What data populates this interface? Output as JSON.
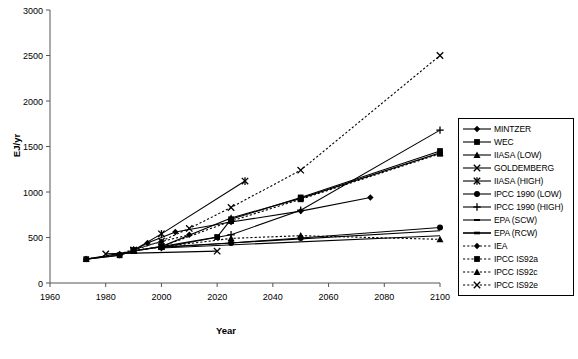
{
  "chart_data": {
    "type": "line",
    "title": "",
    "xlabel": "Year",
    "ylabel": "EJ/yr",
    "xlim": [
      1960,
      2100
    ],
    "ylim": [
      0,
      3000
    ],
    "xticks": [
      1960,
      1980,
      2000,
      2020,
      2040,
      2060,
      2080,
      2100
    ],
    "yticks": [
      0,
      500,
      1000,
      1500,
      2000,
      2500,
      3000
    ],
    "grid": false,
    "legend_position": "right",
    "series": [
      {
        "name": "MINTZER",
        "marker": "diamond",
        "linestyle": "solid",
        "color": "#000000",
        "x": [
          1973,
          1985,
          1990,
          1995,
          2005,
          2025,
          2050,
          2075
        ],
        "y": [
          262,
          305,
          360,
          440,
          560,
          670,
          790,
          940
        ]
      },
      {
        "name": "WEC",
        "marker": "square",
        "linestyle": "solid",
        "color": "#000000",
        "x": [
          1973,
          1985,
          1990,
          2000,
          2020,
          2025,
          2050,
          2100
        ],
        "y": [
          262,
          305,
          355,
          400,
          505,
          700,
          940,
          1450
        ]
      },
      {
        "name": "IIASA (LOW)",
        "marker": "triangle",
        "linestyle": "solid",
        "color": "#000000",
        "x": [
          1973,
          1990,
          2000,
          2025,
          2050,
          2100
        ],
        "y": [
          262,
          350,
          400,
          715,
          930,
          1430
        ]
      },
      {
        "name": "GOLDEMBERG",
        "marker": "x",
        "linestyle": "solid",
        "color": "#000000",
        "x": [
          1980,
          2020
        ],
        "y": [
          320,
          350
        ]
      },
      {
        "name": "IIASA (HIGH)",
        "marker": "star",
        "linestyle": "solid",
        "color": "#000000",
        "x": [
          1990,
          2000,
          2030
        ],
        "y": [
          360,
          540,
          1120
        ]
      },
      {
        "name": "IPCC 1990 (LOW)",
        "marker": "circle",
        "linestyle": "solid",
        "color": "#000000",
        "x": [
          2000,
          2025,
          2050,
          2100
        ],
        "y": [
          390,
          440,
          495,
          610
        ]
      },
      {
        "name": "IPCC 1990 (HIGH)",
        "marker": "plus",
        "linestyle": "solid",
        "color": "#000000",
        "x": [
          2000,
          2025,
          2050,
          2100
        ],
        "y": [
          390,
          530,
          800,
          1680
        ]
      },
      {
        "name": "EPA (SCW)",
        "marker": "none",
        "linestyle": "solid",
        "color": "#000000",
        "x": [
          2000,
          2100
        ],
        "y": [
          395,
          575
        ]
      },
      {
        "name": "EPA (RCW)",
        "marker": "none",
        "linestyle": "solid",
        "color": "#000000",
        "x": [
          2000,
          2100
        ],
        "y": [
          385,
          520
        ]
      },
      {
        "name": "IEA",
        "marker": "diamond",
        "linestyle": "dashed",
        "color": "#000000",
        "x": [
          1973,
          1985,
          1990,
          2000,
          2010
        ],
        "y": [
          262,
          320,
          370,
          455,
          530
        ]
      },
      {
        "name": "IPCC IS92a",
        "marker": "square",
        "linestyle": "dashed",
        "color": "#000000",
        "x": [
          1990,
          2000,
          2025,
          2050,
          2100
        ],
        "y": [
          355,
          400,
          680,
          920,
          1420
        ]
      },
      {
        "name": "IPCC IS92c",
        "marker": "triangle",
        "linestyle": "dashed",
        "color": "#000000",
        "x": [
          1990,
          2000,
          2025,
          2050,
          2100
        ],
        "y": [
          355,
          395,
          490,
          520,
          480
        ]
      },
      {
        "name": "IPCC IS92e",
        "marker": "x",
        "linestyle": "dashed",
        "color": "#000000",
        "x": [
          1990,
          2000,
          2010,
          2025,
          2050,
          2100
        ],
        "y": [
          360,
          460,
          600,
          830,
          1240,
          2500
        ]
      }
    ]
  },
  "legend": {
    "items": [
      {
        "label": "MINTZER"
      },
      {
        "label": "WEC"
      },
      {
        "label": "IIASA (LOW)"
      },
      {
        "label": "GOLDEMBERG"
      },
      {
        "label": "IIASA (HIGH)"
      },
      {
        "label": "IPCC 1990 (LOW)"
      },
      {
        "label": "IPCC 1990 (HIGH)"
      },
      {
        "label": "EPA (SCW)"
      },
      {
        "label": "EPA (RCW)"
      },
      {
        "label": "IEA"
      },
      {
        "label": "IPCC IS92a"
      },
      {
        "label": "IPCC IS92c"
      },
      {
        "label": "IPCC IS92e"
      }
    ]
  }
}
